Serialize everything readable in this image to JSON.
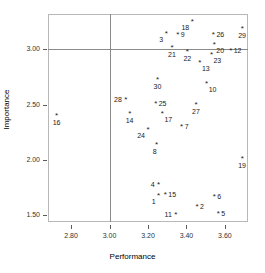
{
  "chart_data": {
    "type": "scatter",
    "title": "",
    "xlabel": "Performance",
    "ylabel": "Importance",
    "xlim": [
      2.68,
      3.72
    ],
    "ylim": [
      1.44,
      3.32
    ],
    "grid": false,
    "legend": null,
    "xticks": [
      "2.80",
      "3.00",
      "3.20",
      "3.40",
      "3.60"
    ],
    "xtick_values": [
      2.8,
      3.0,
      3.2,
      3.4,
      3.6
    ],
    "yticks": [
      "1.50",
      "2.00",
      "2.50",
      "3.00"
    ],
    "ytick_values": [
      1.5,
      2.0,
      2.5,
      3.0
    ],
    "reference_lines": [
      {
        "name": "vertical-mean-line",
        "axis": "x",
        "value": 3.0
      },
      {
        "name": "horizontal-mean-line",
        "axis": "y",
        "value": 3.0
      }
    ],
    "point_labels": [
      "1",
      "2",
      "3",
      "4",
      "5",
      "6",
      "7",
      "8",
      "9",
      "10",
      "11",
      "12",
      "13",
      "14",
      "15",
      "16",
      "17",
      "18",
      "19",
      "20",
      "21",
      "22",
      "23",
      "24",
      "25",
      "26",
      "27",
      "28",
      "29",
      "30"
    ],
    "points": [
      {
        "label": "1",
        "x": 3.255,
        "y": 1.675,
        "label_pos": "bl"
      },
      {
        "label": "2",
        "x": 3.455,
        "y": 1.575,
        "label_pos": "r"
      },
      {
        "label": "3",
        "x": 3.295,
        "y": 3.135,
        "label_pos": "bl"
      },
      {
        "label": "4",
        "x": 3.255,
        "y": 1.775,
        "label_pos": "l"
      },
      {
        "label": "5",
        "x": 3.565,
        "y": 1.515,
        "label_pos": "r"
      },
      {
        "label": "6",
        "x": 3.545,
        "y": 1.665,
        "label_pos": "r"
      },
      {
        "label": "7",
        "x": 3.375,
        "y": 2.295,
        "label_pos": "r"
      },
      {
        "label": "8",
        "x": 3.245,
        "y": 2.135,
        "label_pos": "b"
      },
      {
        "label": "9",
        "x": 3.355,
        "y": 3.13,
        "label_pos": "r"
      },
      {
        "label": "10",
        "x": 3.505,
        "y": 2.69,
        "label_pos": "br"
      },
      {
        "label": "11",
        "x": 3.345,
        "y": 1.5,
        "label_pos": "l"
      },
      {
        "label": "12",
        "x": 3.63,
        "y": 2.985,
        "label_pos": "r"
      },
      {
        "label": "13",
        "x": 3.47,
        "y": 2.88,
        "label_pos": "br"
      },
      {
        "label": "14",
        "x": 3.105,
        "y": 2.415,
        "label_pos": "b"
      },
      {
        "label": "15",
        "x": 3.29,
        "y": 1.68,
        "label_pos": "r"
      },
      {
        "label": "16",
        "x": 2.725,
        "y": 2.4,
        "label_pos": "b"
      },
      {
        "label": "17",
        "x": 3.275,
        "y": 2.415,
        "label_pos": "br"
      },
      {
        "label": "18",
        "x": 3.43,
        "y": 3.245,
        "label_pos": "bl"
      },
      {
        "label": "19",
        "x": 3.69,
        "y": 2.005,
        "label_pos": "b"
      },
      {
        "label": "20",
        "x": 3.545,
        "y": 3.04,
        "label_pos": "br"
      },
      {
        "label": "21",
        "x": 3.325,
        "y": 3.01,
        "label_pos": "b"
      },
      {
        "label": "22",
        "x": 3.405,
        "y": 2.975,
        "label_pos": "b"
      },
      {
        "label": "23",
        "x": 3.53,
        "y": 2.95,
        "label_pos": "br"
      },
      {
        "label": "24",
        "x": 3.2,
        "y": 2.275,
        "label_pos": "bl"
      },
      {
        "label": "25",
        "x": 3.24,
        "y": 2.505,
        "label_pos": "r"
      },
      {
        "label": "26",
        "x": 3.54,
        "y": 3.13,
        "label_pos": "r"
      },
      {
        "label": "27",
        "x": 3.45,
        "y": 2.5,
        "label_pos": "b"
      },
      {
        "label": "28",
        "x": 3.085,
        "y": 2.545,
        "label_pos": "l"
      },
      {
        "label": "29",
        "x": 3.69,
        "y": 3.18,
        "label_pos": "b"
      },
      {
        "label": "30",
        "x": 3.25,
        "y": 2.72,
        "label_pos": "b"
      }
    ],
    "marker_glyph": "*",
    "colors": {
      "marker": "#1a1a1a",
      "reference_line": "#8a8a8a",
      "frame": "#b8b8b8",
      "background": "#ffffff",
      "text": "#000000"
    }
  }
}
